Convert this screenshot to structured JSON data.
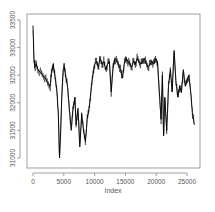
{
  "chart_data": {
    "type": "line",
    "title": "",
    "xlabel": "Index",
    "ylabel": "",
    "xlim": [
      -800,
      27000
    ],
    "ylim": [
      30850,
      33600
    ],
    "grid": false,
    "legend": null,
    "x_ticks": [
      0,
      5000,
      10000,
      15000,
      20000,
      25000
    ],
    "x_tick_labels": [
      "0",
      "5000",
      "10000",
      "15000",
      "20000",
      "25000"
    ],
    "y_ticks": [
      31000,
      31500,
      32000,
      32500,
      33000,
      33500
    ],
    "y_tick_labels": [
      "31000",
      "31500",
      "32000",
      "32500",
      "33000",
      "33500"
    ],
    "series": [
      {
        "name": "series",
        "color": "#000000",
        "x": [
          0,
          150,
          300,
          500,
          800,
          1200,
          1600,
          2000,
          2400,
          2800,
          3000,
          3300,
          3600,
          3900,
          4100,
          4300,
          4500,
          4700,
          4900,
          5100,
          5300,
          5600,
          5900,
          6200,
          6500,
          6800,
          7000,
          7300,
          7600,
          7900,
          8200,
          8500,
          8800,
          9100,
          9400,
          9700,
          10000,
          10300,
          10600,
          10900,
          11200,
          11500,
          11800,
          12100,
          12400,
          12700,
          13000,
          13300,
          13600,
          13900,
          14200,
          14500,
          14800,
          15100,
          15400,
          15700,
          16000,
          16300,
          16600,
          16900,
          17200,
          17500,
          17800,
          18100,
          18400,
          18700,
          19000,
          19300,
          19600,
          19900,
          20200,
          20500,
          20800,
          21000,
          21200,
          21400,
          21700,
          22000,
          22300,
          22600,
          22900,
          23200,
          23500,
          23800,
          24100,
          24400,
          24700,
          25000,
          25300,
          25600,
          25900,
          26200
        ],
        "values": [
          33400,
          32800,
          32650,
          32700,
          32600,
          32550,
          32500,
          32450,
          32350,
          32300,
          32550,
          32700,
          32450,
          32200,
          31800,
          31000,
          31500,
          32200,
          32600,
          32650,
          32500,
          32300,
          31900,
          31500,
          31900,
          32100,
          31600,
          31900,
          31200,
          31800,
          31500,
          31300,
          31700,
          31900,
          32200,
          32500,
          32700,
          32750,
          32650,
          32800,
          32700,
          32750,
          32600,
          32700,
          32750,
          32200,
          32650,
          32800,
          32750,
          32700,
          32600,
          32450,
          32700,
          32800,
          32750,
          32700,
          32650,
          32750,
          32700,
          32800,
          32750,
          32700,
          32750,
          32800,
          32700,
          32650,
          32700,
          32750,
          32700,
          32800,
          32750,
          32200,
          31700,
          32500,
          31400,
          32100,
          31500,
          32300,
          32600,
          32200,
          32950,
          32400,
          32100,
          32300,
          32200,
          32600,
          32300,
          32400,
          32500,
          32200,
          31800,
          31600
        ]
      }
    ]
  }
}
